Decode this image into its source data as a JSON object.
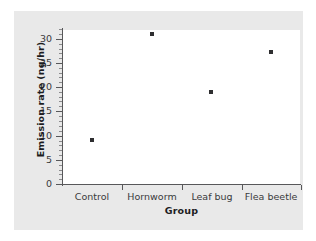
{
  "chart_data": {
    "type": "scatter",
    "title": "",
    "xlabel": "Group",
    "ylabel": "Emission rate (ng/hr)",
    "categories": [
      "Control",
      "Hornworm",
      "Leaf bug",
      "Flea beetle"
    ],
    "values": [
      9.2,
      31.0,
      19.1,
      27.3
    ],
    "series": [
      {
        "name": "Emission rate",
        "values": [
          9.2,
          31.0,
          19.1,
          27.3
        ],
        "marker": "filled-square",
        "color": "#2e2e30"
      }
    ],
    "ylim": [
      0,
      33
    ],
    "yticks": [
      0,
      5,
      10,
      15,
      20,
      25,
      30
    ],
    "ytick_labels": [
      "0",
      "5",
      "10",
      "15",
      "20",
      "25",
      "30"
    ],
    "minor_tick_interval": 1,
    "grid": false,
    "legend": false,
    "legend_position": "none",
    "axis_color": "#58585a",
    "plot_background": "#ffffff",
    "figure_background": "#e9e9e9"
  }
}
